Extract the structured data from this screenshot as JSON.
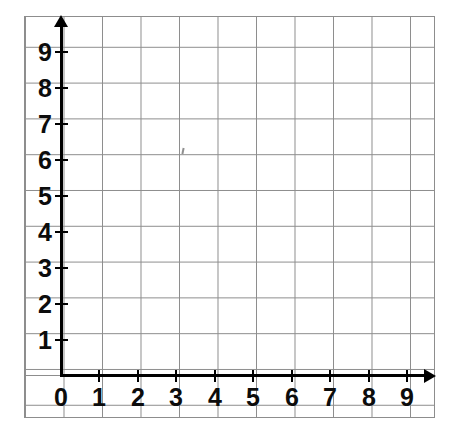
{
  "figure": {
    "kind": "coordinate-grid",
    "background_color": "#ffffff",
    "grid_color": "#8d8d8d",
    "axis_color": "#000000",
    "label_color": "#0c0c0c"
  },
  "chart_data": {
    "type": "scatter",
    "title": "",
    "subtitle": "",
    "xlabel": "",
    "ylabel": "",
    "xlim": [
      0,
      9
    ],
    "ylim": [
      0,
      9
    ],
    "xticks": [
      0,
      1,
      2,
      3,
      4,
      5,
      6,
      7,
      8,
      9
    ],
    "yticks": [
      1,
      2,
      3,
      4,
      5,
      6,
      7,
      8,
      9
    ],
    "x_tick_labels": [
      "0",
      "1",
      "2",
      "3",
      "4",
      "5",
      "6",
      "7",
      "8",
      "9"
    ],
    "y_tick_labels": [
      "1",
      "2",
      "3",
      "4",
      "5",
      "6",
      "7",
      "8",
      "9"
    ],
    "origin_label": "0",
    "grid": true,
    "grid_minor": false,
    "legend": null,
    "legend_position": "none",
    "annotations": [],
    "series": [
      {
        "name": "",
        "x": [],
        "y": [],
        "values": []
      }
    ]
  },
  "axes": {
    "y": {
      "name": "y-axis",
      "arrow": true,
      "ticks": [
        {
          "value": 9,
          "label": "9",
          "px": 52
        },
        {
          "value": 8,
          "label": "8",
          "px": 88
        },
        {
          "value": 7,
          "label": "7",
          "px": 124
        },
        {
          "value": 6,
          "label": "6",
          "px": 160
        },
        {
          "value": 5,
          "label": "5",
          "px": 196
        },
        {
          "value": 4,
          "label": "4",
          "px": 232
        },
        {
          "value": 3,
          "label": "3",
          "px": 268
        },
        {
          "value": 2,
          "label": "2",
          "px": 304
        },
        {
          "value": 1,
          "label": "1",
          "px": 340
        }
      ]
    },
    "x": {
      "name": "x-axis",
      "arrow": true,
      "ticks": [
        {
          "value": 0,
          "label": "0",
          "px": 61
        },
        {
          "value": 1,
          "label": "1",
          "px": 99
        },
        {
          "value": 2,
          "label": "2",
          "px": 138
        },
        {
          "value": 3,
          "label": "3",
          "px": 176
        },
        {
          "value": 4,
          "label": "4",
          "px": 215
        },
        {
          "value": 5,
          "label": "5",
          "px": 253
        },
        {
          "value": 6,
          "label": "6",
          "px": 292
        },
        {
          "value": 7,
          "label": "7",
          "px": 330
        },
        {
          "value": 8,
          "label": "8",
          "px": 369
        },
        {
          "value": 9,
          "label": "9",
          "px": 407
        }
      ]
    }
  },
  "artifacts": {
    "scan_speck": ""
  }
}
